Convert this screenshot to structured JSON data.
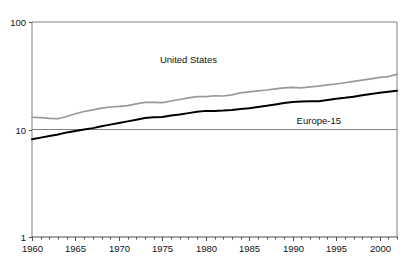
{
  "chart_data": {
    "type": "line",
    "title": "",
    "subtitle": "",
    "xlabel": "",
    "ylabel": "",
    "yscale": "log",
    "ylim": [
      1,
      100
    ],
    "xlim": [
      1960,
      2002
    ],
    "grid": false,
    "legend_position": "inline-annotations",
    "y_tick_labels": [
      "100",
      "10",
      "1"
    ],
    "y_tick_values": [
      100,
      10,
      1
    ],
    "x_tick_labels": [
      "1960",
      "1965",
      "1970",
      "1975",
      "1980",
      "1985",
      "1990",
      "1995",
      "2000"
    ],
    "x_tick_values": [
      1960,
      1965,
      1970,
      1975,
      1980,
      1985,
      1990,
      1995,
      2000
    ],
    "x_minor_tick_interval": 1,
    "x": [
      1960,
      1961,
      1962,
      1963,
      1964,
      1965,
      1966,
      1967,
      1968,
      1969,
      1970,
      1971,
      1972,
      1973,
      1974,
      1975,
      1976,
      1977,
      1978,
      1979,
      1980,
      1981,
      1982,
      1983,
      1984,
      1985,
      1986,
      1987,
      1988,
      1989,
      1990,
      1991,
      1992,
      1993,
      1994,
      1995,
      1996,
      1997,
      1998,
      1999,
      2000,
      2001,
      2002
    ],
    "series": [
      {
        "name": "United States",
        "color": "#999999",
        "label_x": 1978,
        "label_y": 42,
        "values": [
          13.0,
          12.9,
          12.7,
          12.6,
          13.2,
          14.0,
          14.7,
          15.2,
          15.8,
          16.2,
          16.4,
          16.7,
          17.3,
          17.9,
          17.9,
          17.8,
          18.4,
          19.0,
          19.7,
          20.2,
          20.2,
          20.6,
          20.5,
          21.0,
          21.9,
          22.4,
          22.9,
          23.3,
          23.9,
          24.4,
          24.6,
          24.4,
          24.9,
          25.3,
          26.0,
          26.5,
          27.2,
          28.0,
          28.8,
          29.6,
          30.5,
          31.1,
          32.6
        ]
      },
      {
        "name": "Europe-15",
        "color": "#000000",
        "label_x": 1993,
        "label_y": 11.2,
        "values": [
          8.1,
          8.4,
          8.7,
          9.0,
          9.4,
          9.7,
          10.0,
          10.3,
          10.7,
          11.1,
          11.5,
          11.9,
          12.3,
          12.8,
          13.0,
          13.1,
          13.5,
          13.8,
          14.2,
          14.6,
          14.9,
          14.9,
          15.0,
          15.2,
          15.5,
          15.8,
          16.2,
          16.6,
          17.1,
          17.6,
          18.0,
          18.2,
          18.3,
          18.3,
          18.8,
          19.3,
          19.7,
          20.2,
          20.8,
          21.4,
          22.0,
          22.4,
          22.9
        ]
      }
    ]
  }
}
